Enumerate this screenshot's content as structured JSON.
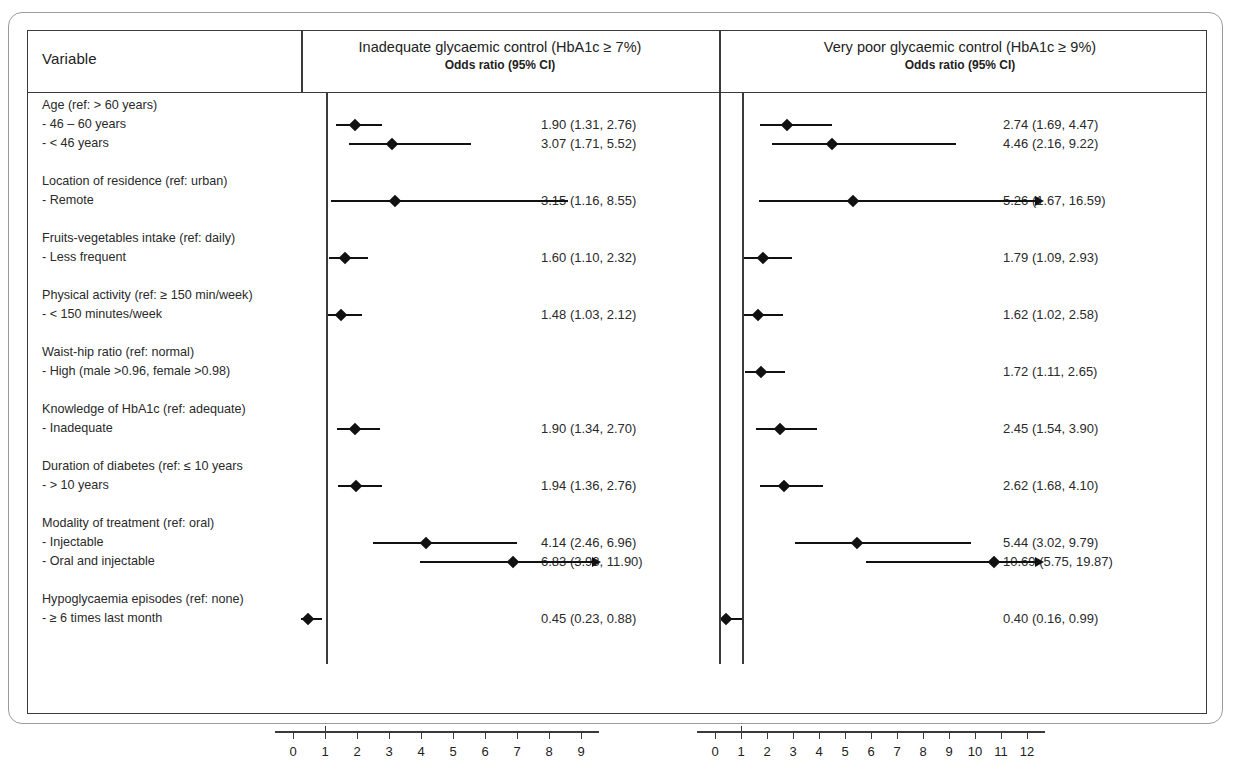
{
  "figure": {
    "type": "forest-plot",
    "variable_header": "Variable",
    "panels": [
      {
        "id": "inadequate",
        "title": "Inadequate glycaemic control (HbA1c ≥ 7%)",
        "subtitle": "Odds ratio (95% CI)",
        "axis": {
          "ticks": [
            0,
            1,
            2,
            3,
            4,
            5,
            6,
            7,
            8,
            9
          ],
          "reference": 1,
          "min": 0,
          "max": 9.6
        }
      },
      {
        "id": "verypoor",
        "title": "Very poor glycaemic control (HbA1c ≥ 9%)",
        "subtitle": "Odds ratio (95% CI)",
        "axis": {
          "ticks": [
            0,
            1,
            2,
            3,
            4,
            5,
            6,
            7,
            8,
            9,
            10,
            11,
            12
          ],
          "reference": 1,
          "min": 0,
          "max": 12.6
        }
      }
    ]
  },
  "chart_data": {
    "type": "scatter",
    "xlabel": "Odds ratio",
    "ylabel": "",
    "grid": false,
    "legend": "none",
    "reference_line": 1,
    "series": [
      {
        "name": "Inadequate glycaemic control (HbA1c ≥ 7%)",
        "xlim": [
          0,
          9.6
        ]
      },
      {
        "name": "Very poor glycaemic control (HbA1c ≥ 9%)",
        "xlim": [
          0,
          12.6
        ]
      }
    ],
    "groups": [
      {
        "heading": "Age (ref: > 60 years)",
        "rows": [
          {
            "label": "- 46 – 60 years",
            "inadequate": {
              "or": 1.9,
              "lcl": 1.31,
              "ucl": 2.76,
              "text": "1.90 (1.31, 2.76)",
              "clipped": false
            },
            "verypoor": {
              "or": 2.74,
              "lcl": 1.69,
              "ucl": 4.47,
              "text": "2.74 (1.69, 4.47)",
              "clipped": false
            }
          },
          {
            "label": "- < 46 years",
            "inadequate": {
              "or": 3.07,
              "lcl": 1.71,
              "ucl": 5.52,
              "text": "3.07 (1.71, 5.52)",
              "clipped": false
            },
            "verypoor": {
              "or": 4.46,
              "lcl": 2.16,
              "ucl": 9.22,
              "text": "4.46 (2.16, 9.22)",
              "clipped": false
            }
          }
        ]
      },
      {
        "heading": "Location of residence (ref: urban)",
        "rows": [
          {
            "label": "- Remote",
            "inadequate": {
              "or": 3.15,
              "lcl": 1.16,
              "ucl": 8.55,
              "text": "3.15 (1.16, 8.55)",
              "clipped": false
            },
            "verypoor": {
              "or": 5.26,
              "lcl": 1.67,
              "ucl": 16.59,
              "text": "5.26 (1.67, 16.59)",
              "clipped": true
            }
          }
        ]
      },
      {
        "heading": "Fruits-vegetables intake (ref: daily)",
        "rows": [
          {
            "label": "- Less frequent",
            "inadequate": {
              "or": 1.6,
              "lcl": 1.1,
              "ucl": 2.32,
              "text": "1.60 (1.10, 2.32)",
              "clipped": false
            },
            "verypoor": {
              "or": 1.79,
              "lcl": 1.09,
              "ucl": 2.93,
              "text": "1.79 (1.09, 2.93)",
              "clipped": false
            }
          }
        ]
      },
      {
        "heading": "Physical activity (ref: ≥ 150 min/week)",
        "rows": [
          {
            "label": "- < 150 minutes/week",
            "inadequate": {
              "or": 1.48,
              "lcl": 1.03,
              "ucl": 2.12,
              "text": "1.48 (1.03, 2.12)",
              "clipped": false
            },
            "verypoor": {
              "or": 1.62,
              "lcl": 1.02,
              "ucl": 2.58,
              "text": "1.62 (1.02, 2.58)",
              "clipped": false
            }
          }
        ]
      },
      {
        "heading": "Waist-hip ratio (ref: normal)",
        "rows": [
          {
            "label": "- High (male >0.96, female >0.98)",
            "inadequate": null,
            "verypoor": {
              "or": 1.72,
              "lcl": 1.11,
              "ucl": 2.65,
              "text": "1.72 (1.11, 2.65)",
              "clipped": false
            }
          }
        ]
      },
      {
        "heading": "Knowledge of HbA1c (ref: adequate)",
        "rows": [
          {
            "label": "- Inadequate",
            "inadequate": {
              "or": 1.9,
              "lcl": 1.34,
              "ucl": 2.7,
              "text": "1.90 (1.34, 2.70)",
              "clipped": false
            },
            "verypoor": {
              "or": 2.45,
              "lcl": 1.54,
              "ucl": 3.9,
              "text": "2.45 (1.54, 3.90)",
              "clipped": false
            }
          }
        ]
      },
      {
        "heading": "Duration of diabetes (ref: ≤ 10 years",
        "rows": [
          {
            "label": "- > 10 years",
            "inadequate": {
              "or": 1.94,
              "lcl": 1.36,
              "ucl": 2.76,
              "text": "1.94 (1.36, 2.76)",
              "clipped": false
            },
            "verypoor": {
              "or": 2.62,
              "lcl": 1.68,
              "ucl": 4.1,
              "text": "2.62 (1.68, 4.10)",
              "clipped": false
            }
          }
        ]
      },
      {
        "heading": "Modality of treatment (ref: oral)",
        "rows": [
          {
            "label": "- Injectable",
            "inadequate": {
              "or": 4.14,
              "lcl": 2.46,
              "ucl": 6.96,
              "text": "4.14 (2.46, 6.96)",
              "clipped": false
            },
            "verypoor": {
              "or": 5.44,
              "lcl": 3.02,
              "ucl": 9.79,
              "text": "5.44 (3.02, 9.79)",
              "clipped": false
            }
          },
          {
            "label": "- Oral and injectable",
            "inadequate": {
              "or": 6.83,
              "lcl": 3.93,
              "ucl": 11.9,
              "text": "6.83 (3.93, 11.90)",
              "clipped": true
            },
            "verypoor": {
              "or": 10.69,
              "lcl": 5.75,
              "ucl": 19.87,
              "text": "10.69 (5.75, 19.87)",
              "clipped": true
            }
          }
        ]
      },
      {
        "heading": "Hypoglycaemia episodes (ref: none)",
        "rows": [
          {
            "label": "- ≥ 6 times last month",
            "inadequate": {
              "or": 0.45,
              "lcl": 0.23,
              "ucl": 0.88,
              "text": "0.45 (0.23, 0.88)",
              "clipped": false
            },
            "verypoor": {
              "or": 0.4,
              "lcl": 0.16,
              "ucl": 0.99,
              "text": "0.40 (0.16, 0.99)",
              "clipped": false
            }
          }
        ]
      }
    ]
  }
}
